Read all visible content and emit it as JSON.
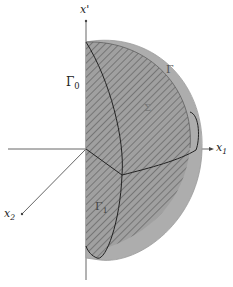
{
  "diagram": {
    "type": "3d-half-ball-domain",
    "axes": {
      "vertical": "x'",
      "right": "x1",
      "diagonal": "x2"
    },
    "labels": {
      "gamma0": "Γ",
      "gamma0_sub": "0",
      "gamma": "Γ",
      "sigma": "Σ",
      "gamma1": "Γ",
      "gamma1_sub": "1"
    },
    "colors": {
      "fill": "#a8a8a8",
      "dark_fill": "#8e8e8e",
      "hatch": "#6a6a6a",
      "line": "#222222",
      "axis": "#555555"
    }
  }
}
